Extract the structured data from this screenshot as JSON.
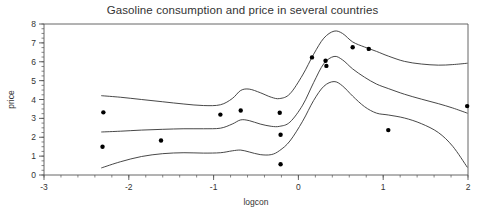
{
  "chart_data": {
    "type": "scatter",
    "title": "Gasoline consumption and price in several countries",
    "xlabel": "logcon",
    "ylabel": "price",
    "xlim": [
      -3,
      2
    ],
    "ylim": [
      0,
      8
    ],
    "xticks": [
      -3,
      -2,
      -1,
      0,
      1,
      2
    ],
    "xtick_labels": [
      "-3",
      "-2",
      "-1",
      "0",
      "1",
      "2"
    ],
    "yticks": [
      0,
      1,
      2,
      3,
      4,
      5,
      6,
      7,
      8
    ],
    "ytick_labels": [
      "0",
      "1",
      "2",
      "3",
      "4",
      "5",
      "6",
      "7",
      "8"
    ],
    "minor_ticks": true,
    "grid": false,
    "legend": "none",
    "points": [
      {
        "x": -2.3,
        "y": 3.32
      },
      {
        "x": -2.31,
        "y": 1.5
      },
      {
        "x": -1.62,
        "y": 1.83
      },
      {
        "x": -0.92,
        "y": 3.2
      },
      {
        "x": -0.68,
        "y": 3.42
      },
      {
        "x": -0.22,
        "y": 3.3
      },
      {
        "x": -0.21,
        "y": 2.13
      },
      {
        "x": -0.21,
        "y": 0.57
      },
      {
        "x": 0.16,
        "y": 6.23
      },
      {
        "x": 0.32,
        "y": 6.05
      },
      {
        "x": 0.33,
        "y": 5.78
      },
      {
        "x": 0.64,
        "y": 6.77
      },
      {
        "x": 0.83,
        "y": 6.68
      },
      {
        "x": 1.06,
        "y": 2.38
      },
      {
        "x": 1.99,
        "y": 3.65
      }
    ],
    "series": [
      {
        "name": "upper-band",
        "x": [
          -2.32,
          -2.1,
          -1.85,
          -1.6,
          -1.35,
          -1.12,
          -0.92,
          -0.78,
          -0.68,
          -0.58,
          -0.45,
          -0.32,
          -0.22,
          -0.1,
          0.05,
          0.18,
          0.3,
          0.42,
          0.52,
          0.64,
          0.78,
          0.92,
          1.06,
          1.25,
          1.45,
          1.65,
          1.82,
          1.99
        ],
        "y": [
          4.2,
          4.12,
          4.0,
          3.88,
          3.76,
          3.68,
          3.72,
          4.05,
          4.48,
          4.55,
          4.36,
          4.12,
          4.05,
          4.3,
          5.3,
          6.4,
          7.25,
          7.62,
          7.5,
          7.05,
          6.78,
          6.55,
          6.3,
          6.02,
          5.88,
          5.82,
          5.85,
          5.92
        ]
      },
      {
        "name": "fitted-curve",
        "x": [
          -2.32,
          -2.1,
          -1.85,
          -1.6,
          -1.35,
          -1.12,
          -0.92,
          -0.78,
          -0.68,
          -0.58,
          -0.45,
          -0.32,
          -0.22,
          -0.1,
          0.05,
          0.18,
          0.3,
          0.42,
          0.52,
          0.64,
          0.78,
          0.92,
          1.06,
          1.25,
          1.45,
          1.65,
          1.82,
          1.99
        ],
        "y": [
          2.28,
          2.32,
          2.38,
          2.42,
          2.45,
          2.45,
          2.48,
          2.7,
          2.92,
          2.88,
          2.7,
          2.58,
          2.58,
          2.8,
          3.7,
          4.9,
          5.9,
          6.28,
          6.1,
          5.62,
          5.18,
          4.82,
          4.58,
          4.28,
          4.02,
          3.78,
          3.55,
          3.28
        ]
      },
      {
        "name": "lower-band",
        "x": [
          -2.32,
          -2.1,
          -1.85,
          -1.6,
          -1.35,
          -1.12,
          -0.92,
          -0.78,
          -0.68,
          -0.58,
          -0.45,
          -0.32,
          -0.22,
          -0.1,
          0.05,
          0.18,
          0.3,
          0.42,
          0.52,
          0.64,
          0.78,
          0.92,
          1.06,
          1.25,
          1.45,
          1.65,
          1.82,
          1.99
        ],
        "y": [
          0.38,
          0.7,
          0.98,
          1.13,
          1.18,
          1.16,
          1.18,
          1.28,
          1.32,
          1.22,
          1.08,
          1.08,
          1.3,
          1.8,
          2.85,
          3.95,
          4.7,
          4.95,
          4.72,
          4.18,
          3.62,
          3.28,
          3.18,
          3.02,
          2.72,
          2.25,
          1.52,
          0.42
        ]
      }
    ]
  },
  "style": {
    "axis_color": "#555555",
    "curve_color": "#333333",
    "point_color": "#000000",
    "background": "#ffffff"
  }
}
